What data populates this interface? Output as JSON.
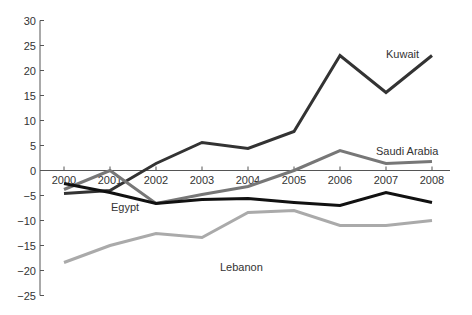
{
  "chart_data": {
    "type": "line",
    "title": "",
    "xlabel": "",
    "ylabel": "",
    "x": [
      "2000",
      "2001",
      "2002",
      "2003",
      "2004",
      "2005",
      "2006",
      "2007",
      "2008"
    ],
    "ylim": [
      -25,
      30
    ],
    "yticks": [
      30,
      25,
      20,
      15,
      10,
      5,
      0,
      -5,
      -10,
      -15,
      -20,
      -25
    ],
    "ytick_labels": [
      "30",
      "25",
      "20",
      "15",
      "10",
      "5",
      "0",
      "−5",
      "−10",
      "−15",
      "−20",
      "−25"
    ],
    "grid": false,
    "legend": "inline labels",
    "series": [
      {
        "name": "Kuwait",
        "color": "#333333",
        "values": [
          -4.6,
          -4.0,
          1.4,
          5.6,
          4.4,
          7.8,
          23.0,
          15.6,
          23.0
        ],
        "label_pos": [
          386,
          58
        ]
      },
      {
        "name": "Saudi Arabia",
        "color": "#777777",
        "values": [
          -3.8,
          0.0,
          -6.6,
          -4.8,
          -3.2,
          0.0,
          4.0,
          1.4,
          1.8
        ],
        "label_pos": [
          376,
          155
        ]
      },
      {
        "name": "Egypt",
        "color": "#111111",
        "values": [
          -2.6,
          -4.4,
          -6.6,
          -5.8,
          -5.6,
          -6.4,
          -7.0,
          -4.4,
          -6.4
        ],
        "label_pos": [
          111,
          211
        ]
      },
      {
        "name": "Lebanon",
        "color": "#aaaaaa",
        "values": [
          -18.4,
          -15.0,
          -12.6,
          -13.4,
          -8.4,
          -8.0,
          -11.0,
          -11.0,
          -10.0
        ],
        "label_pos": [
          220,
          271
        ]
      }
    ]
  }
}
